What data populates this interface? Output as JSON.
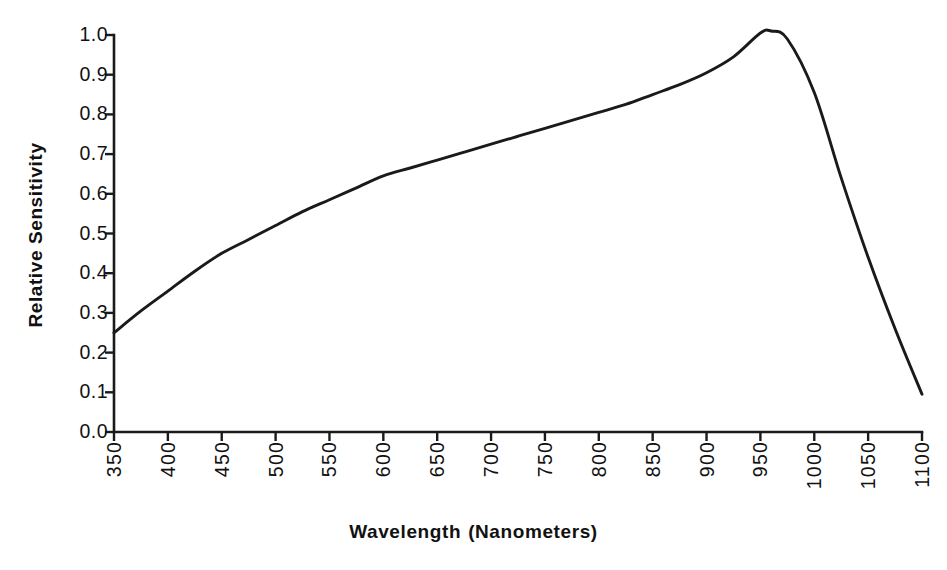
{
  "chart_data": {
    "type": "line",
    "title": "",
    "xlabel": "Wavelength (Nanometers)",
    "ylabel": "Relative Sensitivity",
    "xlim": [
      350,
      1100
    ],
    "ylim": [
      0.0,
      1.0
    ],
    "grid": false,
    "legend": null,
    "line_color": "#1a1a1a",
    "x_tick_labels": [
      "350",
      "400",
      "450",
      "500",
      "550",
      "600",
      "650",
      "700",
      "750",
      "800",
      "850",
      "900",
      "950",
      "1000",
      "1050",
      "1100"
    ],
    "x_ticks": [
      350,
      400,
      450,
      500,
      550,
      600,
      650,
      700,
      750,
      800,
      850,
      900,
      950,
      1000,
      1050,
      1100
    ],
    "y_tick_labels": [
      "1.0",
      "0.9",
      "0.8",
      "0.7",
      "0.6",
      "0.5",
      "0.4",
      "0.3",
      "0.2",
      "0.1",
      "0.0"
    ],
    "y_ticks": [
      1.0,
      0.9,
      0.8,
      0.7,
      0.6,
      0.5,
      0.4,
      0.3,
      0.2,
      0.1,
      0.0
    ],
    "series": [
      {
        "name": "Relative Sensitivity",
        "x": [
          350,
          375,
          400,
          425,
          450,
          475,
          500,
          525,
          550,
          575,
          600,
          625,
          650,
          675,
          700,
          725,
          750,
          775,
          800,
          825,
          850,
          875,
          900,
          925,
          950,
          960,
          975,
          1000,
          1025,
          1050,
          1075,
          1100
        ],
        "y": [
          0.25,
          0.305,
          0.355,
          0.405,
          0.45,
          0.485,
          0.52,
          0.555,
          0.585,
          0.615,
          0.645,
          0.665,
          0.685,
          0.705,
          0.725,
          0.745,
          0.765,
          0.785,
          0.805,
          0.825,
          0.85,
          0.875,
          0.905,
          0.945,
          1.005,
          1.01,
          0.99,
          0.855,
          0.64,
          0.44,
          0.26,
          0.095
        ]
      }
    ],
    "peak": {
      "x": 955,
      "y": 1.01
    }
  },
  "axes": {
    "x_title": {
      "part1": "Wavelength",
      "part2": "(Nanometers)"
    },
    "y_title": "Relative Sensitivity"
  }
}
